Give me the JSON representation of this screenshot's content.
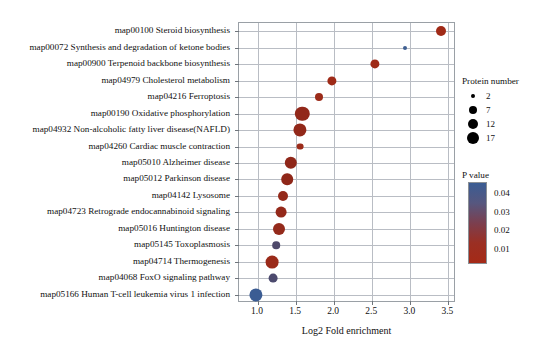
{
  "chart_data": {
    "type": "scatter",
    "title": "",
    "xlabel": "Log2 Fold enrichment",
    "ylabel": "",
    "xlim": [
      0.75,
      3.6
    ],
    "xticks": [
      "1.0",
      "1.5",
      "2.0",
      "2.5",
      "3.0",
      "3.5"
    ],
    "xtickvalues": [
      1.0,
      1.5,
      2.0,
      2.5,
      3.0,
      3.5
    ],
    "grid": true,
    "legend_position": "right",
    "categories": [
      "map00100 Steroid biosynthesis",
      "map00072 Synthesis and degradation of ketone bodies",
      "map00900 Terpenoid backbone biosynthesis",
      "map04979 Cholesterol metabolism",
      "map04216 Ferroptosis",
      "map00190 Oxidative phosphorylation",
      "map04932 Non-alcoholic fatty liver disease(NAFLD)",
      "map04260 Cardiac muscle contraction",
      "map05010 Alzheimer disease",
      "map05012 Parkinson disease",
      "map04142 Lysosome",
      "map04723 Retrograde endocannabinoid signaling",
      "map05016 Huntington disease",
      "map05145 Toxoplasmosis",
      "map04714 Thermogenesis",
      "map04068 FoxO signaling pathway",
      "map05166 Human T-cell leukemia virus 1 infection"
    ],
    "points": [
      {
        "label": "map00100 Steroid biosynthesis",
        "x": 3.4,
        "protein_number": 7,
        "p_value": 0.012,
        "color": "#a02a17",
        "radius": 5.0
      },
      {
        "label": "map00072 Synthesis and degradation of ketone bodies",
        "x": 2.93,
        "protein_number": 2,
        "p_value": 0.04,
        "color": "#3f5f92",
        "radius": 2.0
      },
      {
        "label": "map00900 Terpenoid backbone biosynthesis",
        "x": 2.53,
        "protein_number": 6,
        "p_value": 0.013,
        "color": "#9e2a17",
        "radius": 4.6
      },
      {
        "label": "map04979 Cholesterol metabolism",
        "x": 1.97,
        "protein_number": 6,
        "p_value": 0.013,
        "color": "#9e2a17",
        "radius": 4.6
      },
      {
        "label": "map04216 Ferroptosis",
        "x": 1.8,
        "protein_number": 5,
        "p_value": 0.013,
        "color": "#9c2b19",
        "radius": 4.0
      },
      {
        "label": "map00190 Oxidative phosphorylation",
        "x": 1.58,
        "protein_number": 16,
        "p_value": 0.01,
        "color": "#92281a",
        "radius": 7.2
      },
      {
        "label": "map04932 Non-alcoholic fatty liver disease(NAFLD)",
        "x": 1.55,
        "protein_number": 14,
        "p_value": 0.01,
        "color": "#92281a",
        "radius": 6.6
      },
      {
        "label": "map04260 Cardiac muscle contraction",
        "x": 1.55,
        "protein_number": 4,
        "p_value": 0.012,
        "color": "#9c2b19",
        "radius": 3.4
      },
      {
        "label": "map05010 Alzheimer disease",
        "x": 1.43,
        "protein_number": 12,
        "p_value": 0.01,
        "color": "#8f2719",
        "radius": 6.2
      },
      {
        "label": "map05012 Parkinson disease",
        "x": 1.38,
        "protein_number": 11,
        "p_value": 0.01,
        "color": "#8f2719",
        "radius": 5.8
      },
      {
        "label": "map04142 Lysosome",
        "x": 1.33,
        "protein_number": 8,
        "p_value": 0.011,
        "color": "#94291a",
        "radius": 5.0
      },
      {
        "label": "map04723 Retrograde endocannabinoid signaling",
        "x": 1.3,
        "protein_number": 10,
        "p_value": 0.011,
        "color": "#94291a",
        "radius": 5.4
      },
      {
        "label": "map05016 Huntington disease",
        "x": 1.27,
        "protein_number": 12,
        "p_value": 0.011,
        "color": "#942a1b",
        "radius": 6.0
      },
      {
        "label": "map05145 Toxoplasmosis",
        "x": 1.24,
        "protein_number": 5,
        "p_value": 0.032,
        "color": "#4f4a6b",
        "radius": 3.8
      },
      {
        "label": "map04714 Thermogenesis",
        "x": 1.18,
        "protein_number": 13,
        "p_value": 0.012,
        "color": "#9a2a19",
        "radius": 6.4
      },
      {
        "label": "map04068 FoxO signaling pathway",
        "x": 1.2,
        "protein_number": 7,
        "p_value": 0.033,
        "color": "#4c4a6e",
        "radius": 4.4
      },
      {
        "label": "map05166 Human T-cell leukemia virus 1 infection",
        "x": 0.97,
        "protein_number": 13,
        "p_value": 0.042,
        "color": "#3b5c93",
        "radius": 6.6
      }
    ],
    "size_legend": {
      "title": "Protein number",
      "entries": [
        {
          "label": "2",
          "radius": 1.9
        },
        {
          "label": "7",
          "radius": 4.2
        },
        {
          "label": "12",
          "radius": 5.4
        },
        {
          "label": "17",
          "radius": 6.4
        }
      ]
    },
    "color_legend": {
      "title": "P value",
      "labels": [
        "0.04",
        "0.03",
        "0.02",
        "0.01"
      ],
      "values": [
        0.04,
        0.03,
        0.02,
        0.01
      ],
      "top_color": "#3a5c93",
      "bottom_color": "#a02a17",
      "gradient": [
        "#3a5c93",
        "#56577f",
        "#7b3f4f",
        "#9b2f23",
        "#a52a17"
      ]
    }
  }
}
